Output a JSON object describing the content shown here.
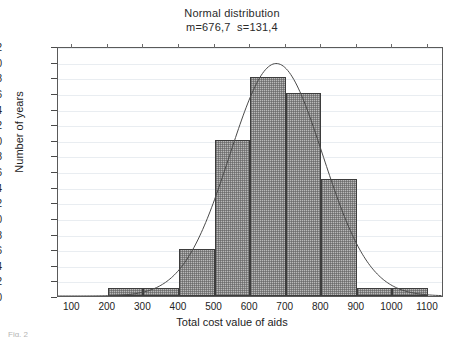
{
  "figure": {
    "title": "Normal distribution",
    "subtitle": "m=676,7  s=131,4",
    "caption": "Fig. 2",
    "corner_artifact": "",
    "colors": {
      "bar_fill": "#b9b9b9",
      "bar_edge": "#3d3d3d",
      "curve": "#4a4a4a",
      "grid": "#e9edf1",
      "axis": "#5a5a5a",
      "text": "#232323"
    }
  },
  "chart_data": {
    "type": "bar",
    "title": "Normal distribution",
    "subtitle": "m=676,7  s=131,4",
    "xlabel": "Total cost value of aids",
    "ylabel": "Number of years",
    "xlim": [
      60,
      1145
    ],
    "ylim": [
      0,
      32
    ],
    "grid": true,
    "legend": "none",
    "xticks": [
      100,
      200,
      300,
      400,
      500,
      600,
      700,
      800,
      900,
      1000,
      1100
    ],
    "yticks": [
      0,
      2,
      4,
      6,
      8,
      10,
      12,
      14,
      16,
      18,
      20,
      22,
      24,
      26,
      28,
      30,
      32
    ],
    "bin_width": 100,
    "bins": [
      {
        "start": 200,
        "end": 300,
        "value": 1
      },
      {
        "start": 300,
        "end": 400,
        "value": 1
      },
      {
        "start": 400,
        "end": 500,
        "value": 6
      },
      {
        "start": 500,
        "end": 600,
        "value": 20
      },
      {
        "start": 600,
        "end": 700,
        "value": 28
      },
      {
        "start": 700,
        "end": 800,
        "value": 26
      },
      {
        "start": 800,
        "end": 900,
        "value": 15
      },
      {
        "start": 900,
        "end": 1000,
        "value": 1
      },
      {
        "start": 1000,
        "end": 1100,
        "value": 1
      }
    ],
    "categories": [
      "200-300",
      "300-400",
      "400-500",
      "500-600",
      "600-700",
      "700-800",
      "800-900",
      "900-1000",
      "1000-1100"
    ],
    "values": [
      1,
      1,
      6,
      20,
      28,
      26,
      15,
      1,
      1
    ],
    "overlay_curve": {
      "type": "normal-fit",
      "mean": 676.7,
      "sd": 131.4,
      "peak_value": 30.0,
      "label": "m=676,7  s=131,4"
    }
  }
}
